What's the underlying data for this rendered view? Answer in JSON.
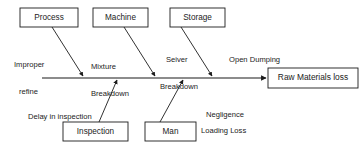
{
  "diagram": {
    "type": "fishbone-ishikawa",
    "effect": {
      "label": "Raw Materials loss"
    },
    "categories": [
      {
        "id": "process",
        "label": "Process",
        "position": "top"
      },
      {
        "id": "machine",
        "label": "Machine",
        "position": "top"
      },
      {
        "id": "storage",
        "label": "Storage",
        "position": "top"
      },
      {
        "id": "inspection",
        "label": "Inspection",
        "position": "bottom"
      },
      {
        "id": "man",
        "label": "Man",
        "position": "bottom"
      }
    ],
    "causes": [
      {
        "id": "improper-refine",
        "line1": "Improper",
        "line2": "refine",
        "category": "process",
        "position": "top"
      },
      {
        "id": "mixture-breakdown",
        "line1": "Mixture",
        "line2": "Breakdown",
        "category": "machine",
        "position": "top"
      },
      {
        "id": "seiver-breakdown",
        "line1": "Seiver",
        "line2": "Breakdown",
        "category": "machine",
        "position": "top"
      },
      {
        "id": "open-dumping",
        "line1": "Open Dumping",
        "line2": "",
        "category": "storage",
        "position": "top"
      },
      {
        "id": "delay-in-inspection",
        "line1": "Delay in inspection",
        "line2": "",
        "category": "inspection",
        "position": "bottom"
      },
      {
        "id": "negligence",
        "line1": "Negligence",
        "line2": "",
        "category": "man",
        "position": "bottom"
      },
      {
        "id": "loading-loss",
        "line1": "Loading Loss",
        "line2": "",
        "category": "man",
        "position": "bottom"
      }
    ],
    "colors": {
      "stroke": "#1b1b1b",
      "text": "#1b1b1b",
      "background": "#ffffff"
    }
  }
}
